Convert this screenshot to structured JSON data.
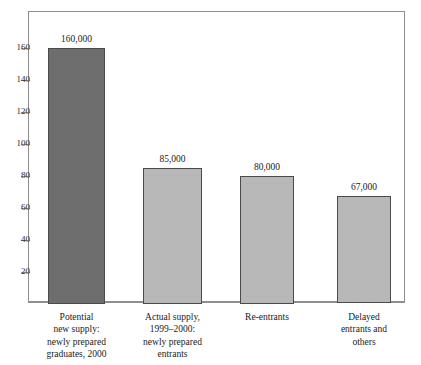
{
  "artifact_text": "",
  "chart_data": {
    "type": "bar",
    "title": "",
    "subtitle": "",
    "xlabel": "",
    "ylabel": "",
    "grid": false,
    "legend": "none",
    "ylim": [
      0,
      170
    ],
    "yticks": [
      20,
      40,
      60,
      80,
      100,
      120,
      140,
      160
    ],
    "ytick_labels": [
      "20",
      "40",
      "60",
      "80",
      "100",
      "120",
      "140",
      "160"
    ],
    "units_note": "values in thousands",
    "categories": [
      "Potential new supply: newly prepared graduates, 2000",
      "Actual supply, 1999–2000: newly prepared entrants",
      "Re-entrants",
      "Delayed entrants and others"
    ],
    "category_lines": [
      [
        "Potential",
        "new supply:",
        "newly prepared",
        "graduates, 2000"
      ],
      [
        "Actual supply,",
        "1999–2000:",
        "newly prepared",
        "entrants"
      ],
      [
        "Re-entrants"
      ],
      [
        "Delayed",
        "entrants and",
        "others"
      ]
    ],
    "values": [
      160,
      85,
      80,
      67
    ],
    "data_labels": [
      "160,000",
      "85,000",
      "80,000",
      "67,000"
    ],
    "bar_colors": [
      "#6e6e6e",
      "#b8b8b8",
      "#b8b8b8",
      "#b8b8b8"
    ],
    "bar_border_color": "#4a4a4a",
    "axis_color": "#8e8e8e",
    "background": "#ffffff"
  }
}
